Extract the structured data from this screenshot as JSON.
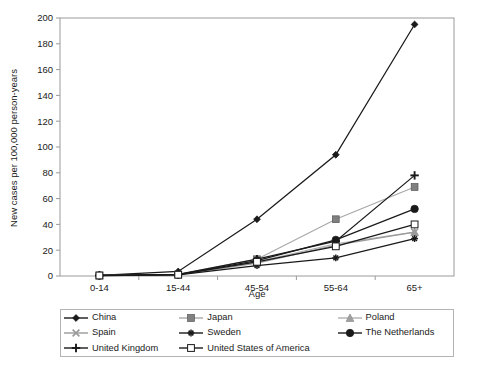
{
  "chart_data": {
    "type": "line",
    "title": "",
    "xlabel": "Age",
    "ylabel": "New cases per 100,000 person-years",
    "categories": [
      "0-14",
      "15-44",
      "45-54",
      "55-64",
      "65+"
    ],
    "ylim": [
      0,
      200
    ],
    "ytick_step": 20,
    "yticks": [
      0,
      20,
      40,
      60,
      80,
      100,
      120,
      140,
      160,
      180,
      200
    ],
    "grid": false,
    "legend_position": "bottom",
    "legend_columns": 3,
    "series": [
      {
        "name": "China",
        "marker": "diamond",
        "color": "#1a1a1a",
        "line_color": "#1a1a1a",
        "values": [
          0.5,
          3.5,
          44,
          94,
          195
        ]
      },
      {
        "name": "Japan",
        "marker": "square-filled",
        "color": "#808080",
        "line_color": "#a8a8a8",
        "values": [
          0.4,
          1.2,
          13,
          44,
          69
        ]
      },
      {
        "name": "Poland",
        "marker": "triangle",
        "color": "#a0a0a0",
        "line_color": "#b0b0b0",
        "values": [
          0.3,
          1.0,
          11,
          25,
          34
        ]
      },
      {
        "name": "Spain",
        "marker": "x",
        "color": "#9a9a9a",
        "line_color": "#9a9a9a",
        "values": [
          0.3,
          0.9,
          10,
          24,
          34
        ]
      },
      {
        "name": "Sweden",
        "marker": "asterisk",
        "color": "#1a1a1a",
        "line_color": "#1a1a1a",
        "values": [
          0.3,
          0.8,
          8,
          14,
          29
        ]
      },
      {
        "name": "The Netherlands",
        "marker": "circle-filled",
        "color": "#1a1a1a",
        "line_color": "#1a1a1a",
        "values": [
          0.4,
          1.1,
          12,
          28,
          52
        ]
      },
      {
        "name": "United Kingdom",
        "marker": "plus",
        "color": "#1a1a1a",
        "line_color": "#1a1a1a",
        "values": [
          0.4,
          1.3,
          13,
          27,
          78
        ]
      },
      {
        "name": "United States of America",
        "marker": "square-open",
        "color": "#1a1a1a",
        "line_color": "#1a1a1a",
        "values": [
          0.4,
          1.0,
          11,
          23,
          40
        ]
      }
    ]
  },
  "legend": {
    "rows": [
      [
        "China",
        "Japan",
        "Poland"
      ],
      [
        "Spain",
        "Sweden",
        "The Netherlands"
      ],
      [
        "United Kingdom",
        "United States of America",
        ""
      ]
    ]
  }
}
